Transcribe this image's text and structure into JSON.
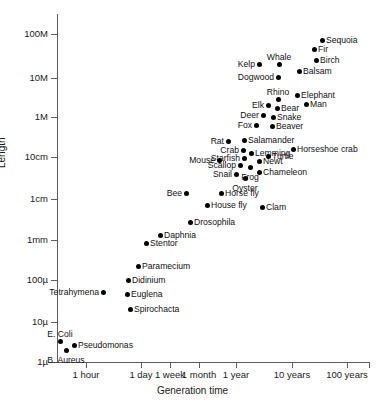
{
  "chart_data": {
    "type": "scatter",
    "title": "",
    "xlabel": "Generation time",
    "ylabel": "Length",
    "grid": false,
    "legend": false,
    "x_scale": "log",
    "y_scale": "log",
    "x_tick_labels": [
      "1 hour",
      "1 day",
      "1 week",
      "1 month",
      "1 year",
      "10 years",
      "100 years"
    ],
    "x_tick_px": [
      86,
      141,
      170,
      199,
      236,
      292,
      347
    ],
    "y_tick_labels": [
      "100M",
      "10M",
      "1M",
      "10cm",
      "1cm",
      "1mm",
      "100µ",
      "10µ",
      "1µ"
    ],
    "y_tick_px": [
      34,
      78,
      117,
      157,
      199,
      240,
      280,
      322,
      362
    ],
    "points": [
      {
        "label": "Sequoia",
        "x_px": 322,
        "y_px": 40,
        "pos": "right"
      },
      {
        "label": "Fir",
        "x_px": 314,
        "y_px": 49,
        "pos": "right"
      },
      {
        "label": "Birch",
        "x_px": 316,
        "y_px": 60,
        "pos": "right"
      },
      {
        "label": "Balsam",
        "x_px": 299,
        "y_px": 71,
        "pos": "right"
      },
      {
        "label": "Whale",
        "x_px": 279,
        "y_px": 64,
        "pos": "above"
      },
      {
        "label": "Kelp",
        "x_px": 259,
        "y_px": 64,
        "pos": "left"
      },
      {
        "label": "Dogwood",
        "x_px": 278,
        "y_px": 77,
        "pos": "left"
      },
      {
        "label": "Elephant",
        "x_px": 297,
        "y_px": 95,
        "pos": "right"
      },
      {
        "label": "Rhino",
        "x_px": 278,
        "y_px": 99,
        "pos": "above"
      },
      {
        "label": "Man",
        "x_px": 306,
        "y_px": 104,
        "pos": "right"
      },
      {
        "label": "Elk",
        "x_px": 268,
        "y_px": 105,
        "pos": "left"
      },
      {
        "label": "Bear",
        "x_px": 277,
        "y_px": 108,
        "pos": "right"
      },
      {
        "label": "Deer",
        "x_px": 263,
        "y_px": 115,
        "pos": "left"
      },
      {
        "label": "Snake",
        "x_px": 273,
        "y_px": 117,
        "pos": "right"
      },
      {
        "label": "Fox",
        "x_px": 256,
        "y_px": 125,
        "pos": "left"
      },
      {
        "label": "Beaver",
        "x_px": 272,
        "y_px": 126,
        "pos": "right"
      },
      {
        "label": "Rat",
        "x_px": 228,
        "y_px": 141,
        "pos": "left"
      },
      {
        "label": "Salamander",
        "x_px": 244,
        "y_px": 140,
        "pos": "right"
      },
      {
        "label": "Horseshoe crab",
        "x_px": 293,
        "y_px": 149,
        "pos": "right"
      },
      {
        "label": "Crab",
        "x_px": 243,
        "y_px": 150,
        "pos": "left"
      },
      {
        "label": "Lemming",
        "x_px": 251,
        "y_px": 153,
        "pos": "right"
      },
      {
        "label": "Turtle",
        "x_px": 268,
        "y_px": 156,
        "pos": "right"
      },
      {
        "label": "Mouse",
        "x_px": 219,
        "y_px": 160,
        "pos": "left"
      },
      {
        "label": "Starfish",
        "x_px": 244,
        "y_px": 158,
        "pos": "left"
      },
      {
        "label": "Newt",
        "x_px": 259,
        "y_px": 161,
        "pos": "right"
      },
      {
        "label": "Scallop",
        "x_px": 240,
        "y_px": 165,
        "pos": "left"
      },
      {
        "label": "Frog",
        "x_px": 250,
        "y_px": 167,
        "pos": "below"
      },
      {
        "label": "Chameleon",
        "x_px": 259,
        "y_px": 172,
        "pos": "right"
      },
      {
        "label": "Snail",
        "x_px": 236,
        "y_px": 174,
        "pos": "left"
      },
      {
        "label": "Oyster",
        "x_px": 245,
        "y_px": 178,
        "pos": "below"
      },
      {
        "label": "Bee",
        "x_px": 186,
        "y_px": 193,
        "pos": "left"
      },
      {
        "label": "Horse fly",
        "x_px": 221,
        "y_px": 193,
        "pos": "right"
      },
      {
        "label": "House fly",
        "x_px": 207,
        "y_px": 205,
        "pos": "right"
      },
      {
        "label": "Clam",
        "x_px": 262,
        "y_px": 207,
        "pos": "right"
      },
      {
        "label": "Drosophila",
        "x_px": 190,
        "y_px": 222,
        "pos": "right"
      },
      {
        "label": "Daphnia",
        "x_px": 160,
        "y_px": 235,
        "pos": "right"
      },
      {
        "label": "Stentor",
        "x_px": 146,
        "y_px": 243,
        "pos": "right"
      },
      {
        "label": "Paramecium",
        "x_px": 138,
        "y_px": 266,
        "pos": "right"
      },
      {
        "label": "Didinium",
        "x_px": 128,
        "y_px": 280,
        "pos": "right"
      },
      {
        "label": "Tetrahymena",
        "x_px": 103,
        "y_px": 292,
        "pos": "left"
      },
      {
        "label": "Euglena",
        "x_px": 127,
        "y_px": 294,
        "pos": "right"
      },
      {
        "label": "Spirochacta",
        "x_px": 130,
        "y_px": 309,
        "pos": "right"
      },
      {
        "label": "E. Coli",
        "x_px": 60,
        "y_px": 341,
        "pos": "above"
      },
      {
        "label": "Pseudomonas",
        "x_px": 74,
        "y_px": 345,
        "pos": "right"
      },
      {
        "label": "B. Aureus",
        "x_px": 66,
        "y_px": 350,
        "pos": "below"
      }
    ]
  }
}
